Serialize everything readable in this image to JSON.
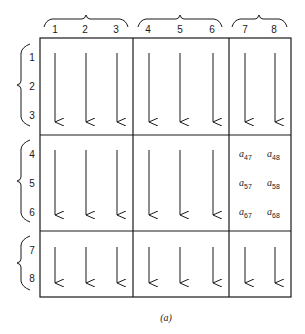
{
  "diagram": {
    "caption": "(a)",
    "column_groups": [
      {
        "columns": [
          "1",
          "2",
          "3"
        ]
      },
      {
        "columns": [
          "4",
          "5",
          "6"
        ]
      },
      {
        "columns": [
          "7",
          "8"
        ]
      }
    ],
    "row_groups": [
      {
        "rows": [
          "1",
          "2",
          "3"
        ]
      },
      {
        "rows": [
          "4",
          "5",
          "6"
        ]
      },
      {
        "rows": [
          "7",
          "8"
        ]
      }
    ],
    "column_labels": [
      "1",
      "2",
      "3",
      "4",
      "5",
      "6",
      "7",
      "8"
    ],
    "row_labels": [
      "1",
      "2",
      "3",
      "4",
      "5",
      "6",
      "7",
      "8"
    ],
    "block_elements": {
      "row_group": 2,
      "col_group": 3,
      "entries": [
        {
          "base": "a",
          "sub": "47"
        },
        {
          "base": "a",
          "sub": "48"
        },
        {
          "base": "a",
          "sub": "57"
        },
        {
          "base": "a",
          "sub": "58"
        },
        {
          "base": "a",
          "sub": "67"
        },
        {
          "base": "a",
          "sub": "68"
        }
      ]
    },
    "arrow_direction": "down"
  }
}
